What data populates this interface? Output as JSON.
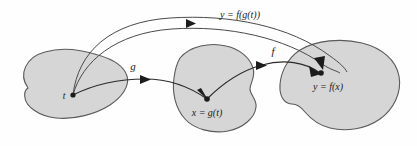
{
  "figure": {
    "type": "diagram",
    "background_color": "#fefefe",
    "blob_fill_color": "#d6d6d6",
    "blob_stroke_color": "#5a5a5a",
    "arrow_color": "#1c1c1c",
    "text_color": "#1a1a1a"
  },
  "sets": [
    {
      "id": "domain-t",
      "point_label": "t",
      "point_x": 72,
      "point_y": 95
    },
    {
      "id": "domain-x",
      "point_label": "x = g(t)",
      "point_x": 207,
      "point_y": 99
    },
    {
      "id": "codomain-y",
      "point_label": "y = f(x)",
      "point_x": 320,
      "point_y": 73
    }
  ],
  "arrows": [
    {
      "id": "arrow-g",
      "label": "g",
      "from": "t",
      "to": "x = g(t)"
    },
    {
      "id": "arrow-f",
      "label": "f",
      "from": "x = g(t)",
      "to": "y = f(x)"
    },
    {
      "id": "arrow-composite",
      "label": "y = f(g(t))",
      "from": "t",
      "to": "y = f(x)"
    }
  ],
  "labels": {
    "t": "t",
    "x_eq_gt": "x = g(t)",
    "y_eq_fx": "y = f(x)",
    "g": "g",
    "f": "f",
    "composite": "y = f(g(t))"
  }
}
